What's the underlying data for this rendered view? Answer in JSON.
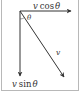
{
  "diagram": {
    "type": "vector-decomposition",
    "vectors": [
      {
        "id": "v",
        "label": "v",
        "from": [
          20,
          11
        ],
        "to": [
          64,
          77
        ]
      },
      {
        "id": "horizontal",
        "label_var": "v",
        "label_func": "cos",
        "label_angle": "θ",
        "from": [
          20,
          11
        ],
        "to": [
          71,
          11
        ]
      },
      {
        "id": "vertical",
        "label_var": "v",
        "label_func": "sin",
        "label_angle": "θ",
        "from": [
          20,
          11
        ],
        "to": [
          20,
          76
        ]
      }
    ],
    "angle": {
      "label": "θ"
    },
    "colors": {
      "stroke": "#333333",
      "border": "#b8b8b8"
    }
  }
}
